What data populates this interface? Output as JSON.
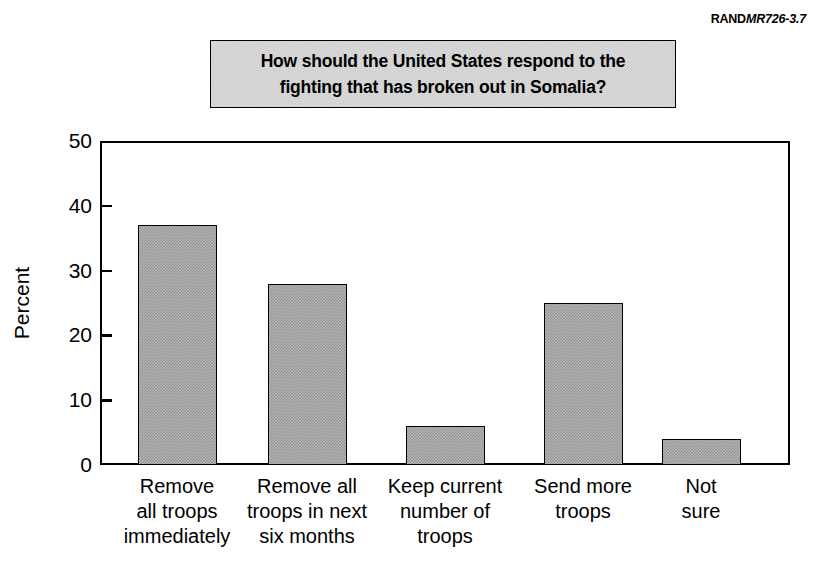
{
  "figure_id": {
    "org": "RAND",
    "report": "MR726-3.7"
  },
  "title": {
    "line1": "How should the United States respond to the",
    "line2": "fighting that has broken out in Somalia?"
  },
  "colors": {
    "bar_fill": "#b4b4b4",
    "bar_dither": "#8f8f8f",
    "bar_outline": "#000000",
    "title_box_fill": "#dcdcdc",
    "title_box_dither": "#c9c9c9",
    "axis": "#000000",
    "background": "#ffffff"
  },
  "chart_data": {
    "type": "bar",
    "title": "How should the United States respond to the fighting that has broken out in Somalia?",
    "xlabel": "",
    "ylabel": "Percent",
    "ylim": [
      0,
      50
    ],
    "yticks": [
      0,
      10,
      20,
      30,
      40,
      50
    ],
    "ytick_labels": [
      "0",
      "10",
      "20",
      "30",
      "40",
      "50"
    ],
    "grid": false,
    "legend": null,
    "categories": [
      "Remove all troops immediately",
      "Remove all troops in next six months",
      "Keep current number of troops",
      "Send more troops",
      "Not sure"
    ],
    "category_label_lines": [
      [
        "Remove",
        "all troops",
        "immediately"
      ],
      [
        "Remove all",
        "troops in next",
        "six months"
      ],
      [
        "Keep current",
        "number of",
        "troops"
      ],
      [
        "Send more",
        "troops"
      ],
      [
        "Not",
        "sure"
      ]
    ],
    "values": [
      37,
      28,
      6,
      25,
      4
    ],
    "value_unit": "percent"
  }
}
